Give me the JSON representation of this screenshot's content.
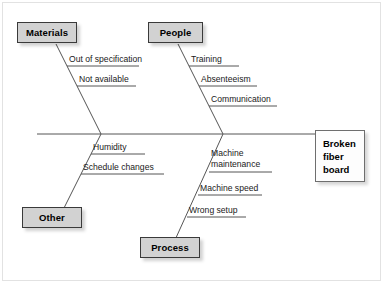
{
  "diagram": {
    "type": "fishbone-ishikawa",
    "effect": {
      "label": "Broken fiber board",
      "line1": "Broken",
      "line2": "fiber",
      "line3": "board"
    },
    "categories": [
      {
        "id": "materials",
        "label": "Materials",
        "position": "top-left",
        "causes": [
          "Out of specification",
          "Not available"
        ]
      },
      {
        "id": "people",
        "label": "People",
        "position": "top-right",
        "causes": [
          "Training",
          "Absenteeism",
          "Communication"
        ]
      },
      {
        "id": "other",
        "label": "Other",
        "position": "bottom-left",
        "causes": [
          "Humidity",
          "Schedule changes"
        ]
      },
      {
        "id": "process",
        "label": "Process",
        "position": "bottom-right",
        "causes": [
          "Machine maintenance",
          "Machine speed",
          "Wrong setup"
        ]
      }
    ],
    "causes": {
      "materials_1": "Out of specification",
      "materials_2": "Not available",
      "people_1": "Training",
      "people_2": "Absenteeism",
      "people_3": "Communication",
      "other_1": "Humidity",
      "other_2": "Schedule changes",
      "process_1_line1": "Machine",
      "process_1_line2": "maintenance",
      "process_2": "Machine speed",
      "process_3": "Wrong setup"
    },
    "colors": {
      "category_fill": "#d2d2d2",
      "category_border": "#3a3a3a",
      "effect_fill": "#fdfdfd",
      "effect_border": "#6e6e6e",
      "line": "#555555",
      "text": "#000000",
      "background": "#ffffff"
    }
  }
}
